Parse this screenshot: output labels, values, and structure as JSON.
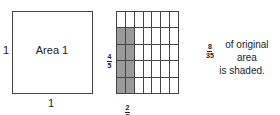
{
  "left_square": {
    "label": "Area 1",
    "side_left": "1",
    "side_bottom": "1"
  },
  "grid": {
    "columns": 7,
    "rows": 5,
    "shaded_columns": 2,
    "shaded_rows": 4,
    "shade_color": "#9a9a9a",
    "height_label": {
      "numerator": "4",
      "denominator": "5"
    },
    "width_label": {
      "numerator": "2",
      "denominator": "7"
    }
  },
  "note": {
    "fraction": {
      "numerator": "8",
      "denominator": "35"
    },
    "line1_text": "of original area",
    "line2_text": "is shaded."
  }
}
